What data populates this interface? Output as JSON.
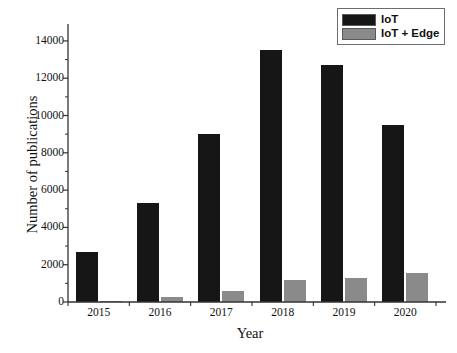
{
  "chart_data": {
    "type": "bar",
    "title": "",
    "xlabel": "Year",
    "ylabel": "Number of publications",
    "categories": [
      "2015",
      "2016",
      "2017",
      "2018",
      "2019",
      "2020"
    ],
    "series": [
      {
        "name": "IoT",
        "color": "#161616",
        "values": [
          2700,
          5300,
          9000,
          13500,
          12700,
          9500
        ]
      },
      {
        "name": "IoT + Edge",
        "color": "#8a8a8a",
        "values": [
          60,
          250,
          600,
          1180,
          1280,
          1550
        ]
      }
    ],
    "ylim": [
      0,
      14800
    ],
    "yticks": [
      0,
      2000,
      4000,
      6000,
      8000,
      10000,
      12000,
      14000
    ],
    "ytick_labels": [
      "0",
      "2000",
      "4000",
      "6000",
      "8000",
      "10000",
      "12000",
      "14000"
    ],
    "minor_ticks": true,
    "grid": false,
    "legend_position": "top-right"
  },
  "legend": {
    "entries": [
      {
        "label": "IoT",
        "color": "#161616"
      },
      {
        "label": "IoT + Edge",
        "color": "#8a8a8a"
      }
    ]
  },
  "axes": {
    "x_title": "Year",
    "y_title": "Number of publications"
  }
}
